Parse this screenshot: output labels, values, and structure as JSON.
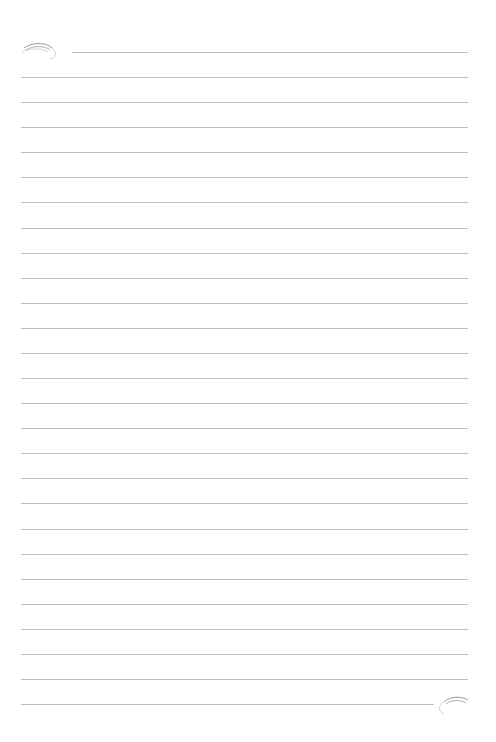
{
  "page": {
    "type": "lined-paper",
    "background": "#ffffff",
    "line_color": "#bdbdbd",
    "line_count": 27,
    "line_spacing_px": 25.08,
    "first_line_y": 52,
    "line_left": 21,
    "line_right": 468,
    "top_line_left": 72,
    "bottom_line_right": 434,
    "ornaments": [
      {
        "name": "top-left-flourish",
        "position": "top-left"
      },
      {
        "name": "bottom-right-flourish",
        "position": "bottom-right"
      }
    ]
  }
}
